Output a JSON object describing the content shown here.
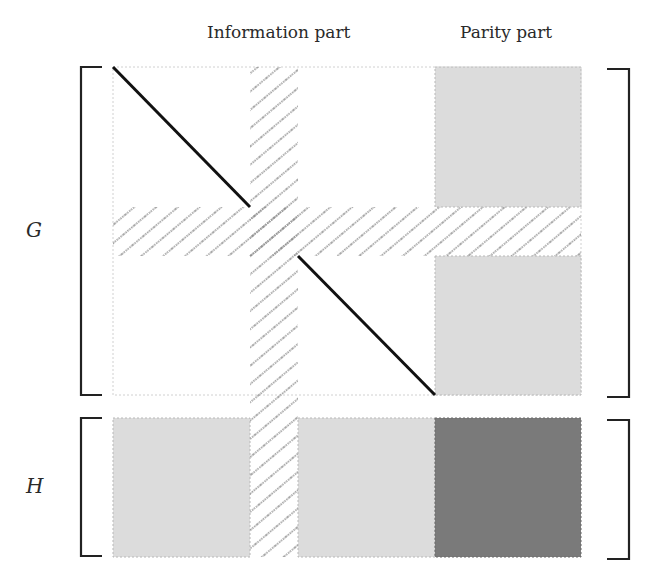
{
  "diagram": {
    "column_labels": {
      "information": "Information part",
      "parity": "Parity part"
    },
    "matrix_labels": {
      "generator": "G",
      "parity_check": "H"
    },
    "colors": {
      "light_gray": "#dcdcdc",
      "dark_gray": "#7a7a7a",
      "hatch": "#8c8c8c",
      "line": "#111111",
      "bracket": "#222222"
    },
    "structure": {
      "G": {
        "information_part": "identity diagonal with erased (hatched) row and column",
        "parity_part": "light gray blocks, erased row hatched"
      },
      "H": {
        "information_part": "light gray blocks, erased column hatched",
        "parity_part": "dark gray block"
      }
    }
  }
}
